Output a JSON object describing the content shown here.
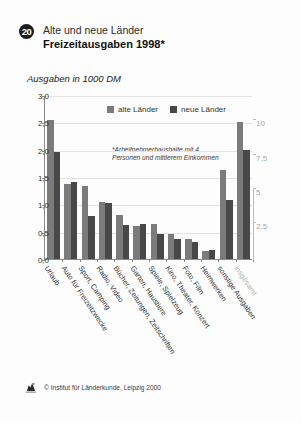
{
  "header": {
    "badge": "20",
    "kicker": "Alte und neue Länder",
    "title": "Freizeitausgaben 1998*"
  },
  "subtitle": "Ausgaben in 1000 DM",
  "footnote": "*Arbeitnehmerhaushalte mit 4 Personen und mittlerem Einkommen",
  "footer": {
    "copyright": "© Institut für Länderkunde, Leipzig 2000",
    "logo_icon": "ifl-logo-icon"
  },
  "colors": {
    "alte": "#7b7b7b",
    "neue": "#484848",
    "axis": "#8a8a8a",
    "grid": "#e2e2e2",
    "right_axis": "#b4b4b4"
  },
  "chart_data": {
    "type": "bar",
    "title": "Freizeitausgaben 1998*",
    "subtitle": "Alte und neue Länder",
    "xlabel": "",
    "ylabel": "Ausgaben in 1000 DM",
    "ylim": [
      0,
      3.0
    ],
    "yticks": [
      "0,0",
      "0,5",
      "1,0",
      "1,5",
      "2,0",
      "2,5",
      "3,0"
    ],
    "ytick_values": [
      0,
      0.5,
      1.0,
      1.5,
      2.0,
      2.5,
      3.0
    ],
    "secondary_axis": {
      "label": "",
      "ylim": [
        0,
        12
      ],
      "ticks": [
        "2,5",
        "5",
        "7,5",
        "10"
      ],
      "tick_values": [
        2.5,
        5,
        7.5,
        10
      ],
      "applies_to": [
        "sonstige Ausgaben",
        "insgesamt"
      ]
    },
    "grid": true,
    "legend": [
      "alte Länder",
      "neue Länder"
    ],
    "legend_position": "top-center",
    "annotations": [
      "*Arbeitnehmerhaushalte mit 4 Personen und mittlerem Einkommen"
    ],
    "categories": [
      "Urlaub",
      "Auto für Freizeitzwecke",
      "Sport, Camping",
      "Radio, Video",
      "Bücher, Zeitungen, Zeitschriften",
      "Garten, Haustiere",
      "Spiele, Spielzeug",
      "Kino, Theater, Konzert",
      "Foto, Film",
      "Heimwerken",
      "sonstige Ausgaben",
      "insgesamt"
    ],
    "series": [
      {
        "name": "alte Länder",
        "values": [
          2.54,
          1.38,
          1.33,
          1.05,
          0.8,
          0.61,
          0.64,
          0.46,
          0.36,
          0.15,
          6.5,
          10.0
        ]
      },
      {
        "name": "neue Länder",
        "values": [
          1.95,
          1.4,
          0.79,
          1.02,
          0.62,
          0.64,
          0.46,
          0.37,
          0.31,
          0.16,
          4.3,
          8.0
        ]
      }
    ]
  }
}
